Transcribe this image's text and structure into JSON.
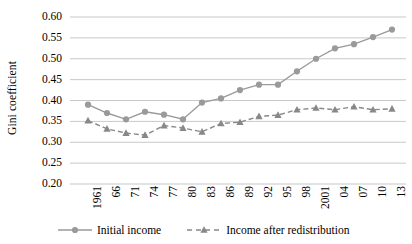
{
  "chart_data": {
    "type": "line",
    "title": "",
    "xlabel": "",
    "ylabel": "Gini coefficient",
    "ylim": [
      0.2,
      0.6
    ],
    "ytick_step": 0.05,
    "grid": true,
    "legend_position": "bottom",
    "categories": [
      "1961",
      "66",
      "71",
      "74",
      "77",
      "80",
      "83",
      "86",
      "89",
      "92",
      "95",
      "98",
      "2001",
      "04",
      "07",
      "10",
      "13"
    ],
    "yticks": [
      "0.60",
      "0.55",
      "0.50",
      "0.45",
      "0.40",
      "0.35",
      "0.30",
      "0.25",
      "0.20"
    ],
    "ytick_values": [
      0.6,
      0.55,
      0.5,
      0.45,
      0.4,
      0.35,
      0.3,
      0.25,
      0.2
    ],
    "series": [
      {
        "name": "Initial income",
        "marker": "circle",
        "linestyle": "solid",
        "color": "#9a9a9a",
        "values": [
          0.39,
          0.37,
          0.355,
          0.373,
          0.366,
          0.355,
          0.395,
          0.405,
          0.425,
          0.438,
          0.438,
          0.47,
          0.5,
          0.525,
          0.535,
          0.552,
          0.57
        ]
      },
      {
        "name": "Income after redistribution",
        "marker": "triangle",
        "linestyle": "dashed",
        "color": "#888888",
        "values": [
          0.352,
          0.332,
          0.322,
          0.317,
          0.34,
          0.334,
          0.325,
          0.345,
          0.348,
          0.362,
          0.365,
          0.378,
          0.382,
          0.378,
          0.385,
          0.378,
          0.38
        ]
      }
    ]
  },
  "axis": {
    "y_title": "Gini coefficient"
  },
  "legend": {
    "items": [
      {
        "label": "Initial income"
      },
      {
        "label": "Income after redistribution"
      }
    ]
  },
  "colors": {
    "series_1": "#9a9a9a",
    "series_2": "#888888",
    "gridline": "#c8c8c8",
    "axis": "#808080",
    "text": "#000000"
  }
}
